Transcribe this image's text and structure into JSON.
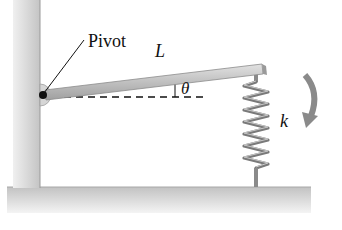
{
  "figure": {
    "type": "physics-diagram"
  },
  "labels": {
    "pivot": "Pivot",
    "length": "L",
    "angle": "θ",
    "spring_constant": "k"
  },
  "elements": {
    "wall": {
      "x": 13,
      "y": 0,
      "width": 27,
      "height": 190
    },
    "ground": {
      "x": 7,
      "y": 187,
      "width": 304,
      "height": 26
    },
    "pivot_point": {
      "x": 43,
      "y": 95
    },
    "rod": {
      "x1": 45,
      "y1": 95,
      "x2": 262,
      "y2": 70,
      "thickness": 10
    },
    "reference_line": {
      "x1": 52,
      "y1": 97,
      "x2": 206,
      "y2": 97,
      "style": "dashed"
    },
    "spring": {
      "x": 256,
      "top": 78,
      "bottom": 187,
      "coils": 10
    },
    "rotation_arrow": {
      "direction": "clockwise"
    }
  },
  "colors": {
    "structure": "#c8c8c8",
    "structure_dark": "#9a9a9a",
    "spring": "#7a7a7a",
    "arrow": "#8a8a8a",
    "text": "#111111"
  }
}
